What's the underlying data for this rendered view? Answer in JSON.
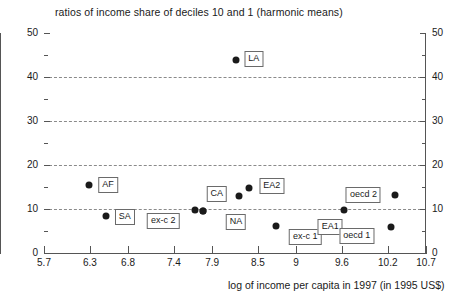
{
  "chart_data": {
    "type": "scatter",
    "title": "ratios of income share of deciles 10 and 1 (harmonic means)",
    "xlabel": "log of income per capita in 1997 (in 1995 US$)",
    "ylabel": "",
    "xlim": [
      5.7,
      10.7
    ],
    "ylim": [
      0,
      50
    ],
    "xticks": [
      "5.7",
      "6.3",
      "6.8",
      "7.4",
      "7.9",
      "8.5",
      "9",
      "9.6",
      "10.2",
      "10.7"
    ],
    "xtick_values": [
      5.7,
      6.3,
      6.8,
      7.4,
      7.9,
      8.5,
      9.0,
      9.6,
      10.2,
      10.7
    ],
    "yticks": [
      "0",
      "10",
      "20",
      "30",
      "40",
      "50"
    ],
    "ytick_values": [
      0,
      10,
      20,
      30,
      40,
      50
    ],
    "yticks_minor": [
      5,
      15,
      25,
      35,
      45
    ],
    "gridlines_y": [
      10,
      20,
      30,
      40
    ],
    "grid": "horizontal dashed at y = 10, 20, 30, 40",
    "legend": "none; points annotated with boxed labels",
    "y_axis_duplicated_right": true,
    "marker": {
      "shape": "circle",
      "color": "#1a1a1a",
      "size_px": 7
    },
    "points": [
      {
        "label": "LA",
        "x": 8.21,
        "y": 43.9,
        "label_dx": 18,
        "label_dy": -1
      },
      {
        "label": "AF",
        "x": 6.29,
        "y": 15.5,
        "label_dx": 19,
        "label_dy": 0
      },
      {
        "label": "SA",
        "x": 6.51,
        "y": 8.4,
        "label_dx": 19,
        "label_dy": 1
      },
      {
        "label": "ex-c 2",
        "x": 7.68,
        "y": 9.8,
        "label_dx": -32,
        "label_dy": 11
      },
      {
        "label": "",
        "x": 7.78,
        "y": 9.5,
        "label_dx": 0,
        "label_dy": 0
      },
      {
        "label": "NA",
        "x": 7.78,
        "y": 9.5,
        "label_dx": 33,
        "label_dy": 11
      },
      {
        "label": "CA",
        "x": 8.25,
        "y": 13.0,
        "label_dx": -22,
        "label_dy": -2
      },
      {
        "label": "EA2",
        "x": 8.38,
        "y": 14.8,
        "label_dx": 23,
        "label_dy": -2
      },
      {
        "label": "ex-c 1",
        "x": 8.74,
        "y": 6.1,
        "label_dx": 29,
        "label_dy": 11
      },
      {
        "label": "EA1",
        "x": 9.63,
        "y": 9.8,
        "label_dx": -14,
        "label_dy": 17
      },
      {
        "label": "oecd 2",
        "x": 10.3,
        "y": 13.2,
        "label_dx": -32,
        "label_dy": 0
      },
      {
        "label": "oecd 1",
        "x": 10.24,
        "y": 5.9,
        "label_dx": -34,
        "label_dy": 9
      }
    ]
  }
}
